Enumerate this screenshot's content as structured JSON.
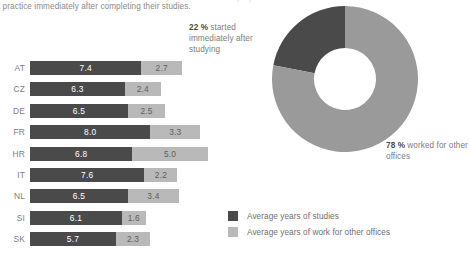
{
  "caption": {
    "ghost_line": "ed in the country where they study, and how many of them found employ-",
    "text": "dent practice immediately after completing their studies."
  },
  "chart_data": [
    {
      "type": "bar",
      "orientation": "horizontal",
      "stacked": true,
      "title": "",
      "xlabel": "",
      "ylabel": "",
      "grid": false,
      "categories": [
        "AT",
        "CZ",
        "DE",
        "FR",
        "HR",
        "IT",
        "NL",
        "SI",
        "SK"
      ],
      "series": [
        {
          "name": "Average years of studies",
          "color": "#4a4a4a",
          "values": [
            7.4,
            6.3,
            6.5,
            8.0,
            6.8,
            7.6,
            6.5,
            6.1,
            5.7
          ]
        },
        {
          "name": "Average years of work for other offices",
          "color": "#b9b9b9",
          "values": [
            2.7,
            2.4,
            2.5,
            3.3,
            5.0,
            2.2,
            3.4,
            1.6,
            2.3
          ]
        }
      ],
      "value_labels": [
        [
          "7.4",
          "2.7"
        ],
        [
          "6.3",
          "2.4"
        ],
        [
          "6.5",
          "2.5"
        ],
        [
          "8.0",
          "3.3"
        ],
        [
          "6.8",
          "5.0"
        ],
        [
          "7.6",
          "2.2"
        ],
        [
          "6.5",
          "3.4"
        ],
        [
          "6.1",
          "1.6"
        ],
        [
          "5.7",
          "2.3"
        ]
      ]
    },
    {
      "type": "pie",
      "variant": "donut",
      "title": "",
      "legend_position": "none",
      "labels": [
        "started immediately after studying",
        "worked for other offices"
      ],
      "values": [
        22,
        78
      ],
      "value_labels": [
        "22 %",
        "78 %"
      ],
      "colors": [
        "#4a4a4a",
        "#9a9a9a"
      ]
    }
  ],
  "donut": {
    "annotation_top": {
      "value": "22 %",
      "text": " started immediately after studying"
    },
    "annotation_bottom": {
      "value": "78 %",
      "text": " worked for other offices"
    }
  },
  "legend": {
    "items": [
      {
        "label": "Average years of studies",
        "color": "#4a4a4a"
      },
      {
        "label": "Average years of work for other offices",
        "color": "#b9b9b9"
      }
    ]
  },
  "colors": {
    "dark": "#4a4a4a",
    "light": "#b9b9b9",
    "donut_light": "#9a9a9a",
    "text": "#7d7d7d",
    "background": "#ffffff"
  }
}
